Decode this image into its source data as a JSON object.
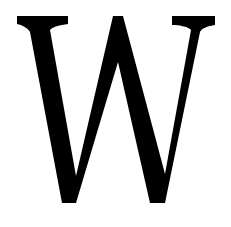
{
  "logo": {
    "glyph": "W",
    "icon": "serif-w-logo-icon",
    "color": "#000000",
    "background": "#ffffff"
  }
}
